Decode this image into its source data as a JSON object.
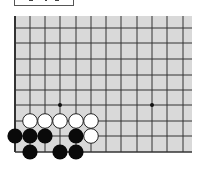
{
  "board": {
    "background": "#d9d9d9",
    "line_color": "#333333",
    "origin": {
      "x": 15,
      "y": 16
    },
    "columns_x": [
      15,
      30,
      45,
      60,
      76,
      91,
      106,
      121,
      137,
      152,
      167,
      183
    ],
    "rows_y": [
      28,
      43,
      59,
      75,
      90,
      105,
      121,
      136,
      152
    ],
    "right_edge": 192,
    "star_points": [
      {
        "x": 60,
        "y": 105
      },
      {
        "x": 152,
        "y": 105
      }
    ],
    "stones": {
      "white": [
        {
          "x": 30,
          "y": 121
        },
        {
          "x": 45,
          "y": 121
        },
        {
          "x": 60,
          "y": 121
        },
        {
          "x": 76,
          "y": 121
        },
        {
          "x": 91,
          "y": 121
        },
        {
          "x": 91,
          "y": 136
        }
      ],
      "black": [
        {
          "x": 15,
          "y": 136
        },
        {
          "x": 30,
          "y": 136
        },
        {
          "x": 45,
          "y": 136
        },
        {
          "x": 76,
          "y": 136
        },
        {
          "x": 30,
          "y": 152
        },
        {
          "x": 60,
          "y": 152
        },
        {
          "x": 76,
          "y": 152
        }
      ]
    }
  }
}
